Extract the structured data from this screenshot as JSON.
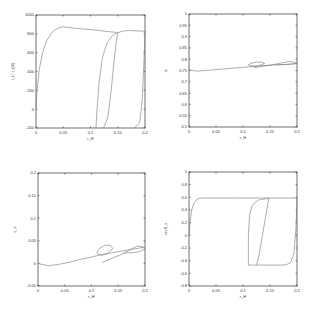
{
  "chart_data": [
    {
      "type": "line",
      "id": "top-left",
      "title": "",
      "xlabel": "r_H",
      "ylabel": "r_t / r_{t0}",
      "xlim": [
        0,
        0.2
      ],
      "ylim": [
        -200,
        1000
      ],
      "xticks": [
        "0",
        "0.05",
        "0.1",
        "0.15",
        "0.2"
      ],
      "yticks": [
        "-200",
        "0",
        "200",
        "400",
        "600",
        "800",
        "1000"
      ],
      "series": [
        {
          "name": "branch-1",
          "x": [
            0.0,
            0.002,
            0.006,
            0.012,
            0.02,
            0.03,
            0.04,
            0.05,
            0.07,
            0.09,
            0.11,
            0.13,
            0.148,
            0.15
          ],
          "y": [
            20,
            200,
            420,
            600,
            730,
            820,
            860,
            875,
            860,
            850,
            840,
            825,
            815,
            812
          ]
        },
        {
          "name": "branch-2",
          "x": [
            0.11,
            0.112,
            0.116,
            0.122,
            0.13,
            0.14,
            0.148
          ],
          "y": [
            -200,
            0,
            300,
            550,
            700,
            780,
            812
          ]
        },
        {
          "name": "branch-3",
          "x": [
            0.124,
            0.132,
            0.138,
            0.143,
            0.147,
            0.15
          ],
          "y": [
            -200,
            -80,
            200,
            500,
            700,
            812
          ]
        },
        {
          "name": "branch-4",
          "x": [
            0.15,
            0.16,
            0.17,
            0.18,
            0.19,
            0.2
          ],
          "y": [
            812,
            830,
            835,
            832,
            830,
            828
          ]
        },
        {
          "name": "branch-5",
          "x": [
            0.18,
            0.19,
            0.195,
            0.198,
            0.2
          ],
          "y": [
            -200,
            -150,
            100,
            500,
            828
          ]
        }
      ]
    },
    {
      "type": "line",
      "id": "top-right",
      "title": "",
      "xlabel": "r_H",
      "ylabel": "a",
      "xlim": [
        0,
        0.2
      ],
      "ylim": [
        0.5,
        1
      ],
      "xticks": [
        "0",
        "0.05",
        "0.1",
        "0.15",
        "0.2"
      ],
      "yticks": [
        "0.5",
        "0.55",
        "0.6",
        "0.65",
        "0.7",
        "0.75",
        "0.8",
        "0.85",
        "0.9",
        "0.95",
        "1"
      ],
      "series": [
        {
          "name": "main",
          "x": [
            0.0,
            0.01,
            0.02,
            0.04,
            0.06,
            0.08,
            0.1,
            0.11,
            0.12,
            0.135,
            0.15,
            0.17,
            0.19,
            0.2
          ],
          "y": [
            0.755,
            0.748,
            0.748,
            0.752,
            0.756,
            0.76,
            0.764,
            0.766,
            0.768,
            0.771,
            0.773,
            0.776,
            0.779,
            0.78
          ]
        },
        {
          "name": "loop-1",
          "x": [
            0.11,
            0.115,
            0.125,
            0.135,
            0.14,
            0.13,
            0.12,
            0.112,
            0.11
          ],
          "y": [
            0.775,
            0.782,
            0.787,
            0.787,
            0.781,
            0.772,
            0.77,
            0.771,
            0.775
          ]
        },
        {
          "name": "loop-2",
          "x": [
            0.12,
            0.14,
            0.16,
            0.175,
            0.185,
            0.195,
            0.2,
            0.19,
            0.18,
            0.16
          ],
          "y": [
            0.762,
            0.77,
            0.778,
            0.785,
            0.79,
            0.787,
            0.783,
            0.778,
            0.776,
            0.775
          ]
        }
      ]
    },
    {
      "type": "line",
      "id": "bottom-left",
      "title": "",
      "xlabel": "r_H",
      "ylabel": "s_e",
      "xlim": [
        0,
        0.2
      ],
      "ylim": [
        -0.05,
        0.2
      ],
      "xticks": [
        "0",
        "0.05",
        "0.1",
        "0.15",
        "0.2"
      ],
      "yticks": [
        "-0.05",
        "0",
        "0.05",
        "0.1",
        "0.15",
        "0.2"
      ],
      "series": [
        {
          "name": "main",
          "x": [
            0.0,
            0.01,
            0.02,
            0.04,
            0.06,
            0.08,
            0.1,
            0.11,
            0.12,
            0.135,
            0.15,
            0.17,
            0.19,
            0.2
          ],
          "y": [
            0.0,
            -0.003,
            -0.005,
            -0.002,
            0.003,
            0.009,
            0.014,
            0.017,
            0.02,
            0.023,
            0.026,
            0.03,
            0.034,
            0.036
          ]
        },
        {
          "name": "loop-1",
          "x": [
            0.11,
            0.115,
            0.125,
            0.135,
            0.14,
            0.13,
            0.12,
            0.112,
            0.11
          ],
          "y": [
            0.025,
            0.033,
            0.04,
            0.04,
            0.033,
            0.022,
            0.018,
            0.02,
            0.025
          ]
        },
        {
          "name": "loop-2",
          "x": [
            0.12,
            0.14,
            0.16,
            0.175,
            0.185,
            0.195,
            0.2,
            0.19,
            0.18,
            0.16
          ],
          "y": [
            0.002,
            0.012,
            0.022,
            0.032,
            0.038,
            0.037,
            0.032,
            0.026,
            0.024,
            0.023
          ]
        }
      ]
    },
    {
      "type": "line",
      "id": "bottom-right",
      "title": "",
      "xlabel": "r_H",
      "ylabel": "sin θ_s",
      "xlim": [
        0,
        0.2
      ],
      "ylim": [
        -0.8,
        1
      ],
      "xticks": [
        "0",
        "0.05",
        "0.1",
        "0.15",
        "0.2"
      ],
      "yticks": [
        "-0.8",
        "-0.6",
        "-0.4",
        "-0.2",
        "0",
        "0.2",
        "0.4",
        "0.6",
        "0.8",
        "1"
      ],
      "series": [
        {
          "name": "branch-1",
          "x": [
            0.0,
            0.002,
            0.005,
            0.01,
            0.015,
            0.02,
            0.03,
            0.05,
            0.08,
            0.1,
            0.15,
            0.2
          ],
          "y": [
            0.0,
            0.2,
            0.4,
            0.52,
            0.57,
            0.585,
            0.59,
            0.59,
            0.59,
            0.59,
            0.59,
            0.59
          ]
        },
        {
          "name": "branch-2",
          "x": [
            0.11,
            0.11,
            0.112,
            0.116,
            0.122,
            0.13,
            0.14,
            0.148
          ],
          "y": [
            -0.47,
            0.0,
            0.3,
            0.45,
            0.52,
            0.56,
            0.575,
            0.585
          ]
        },
        {
          "name": "branch-3",
          "x": [
            0.11,
            0.12,
            0.125
          ],
          "y": [
            -0.47,
            -0.47,
            -0.47
          ]
        },
        {
          "name": "branch-4",
          "x": [
            0.125,
            0.13,
            0.136,
            0.142,
            0.146,
            0.148
          ],
          "y": [
            -0.47,
            -0.3,
            0.0,
            0.3,
            0.5,
            0.585
          ]
        },
        {
          "name": "branch-5",
          "x": [
            0.125,
            0.15,
            0.17,
            0.18,
            0.188,
            0.194,
            0.198,
            0.2
          ],
          "y": [
            -0.47,
            -0.47,
            -0.47,
            -0.465,
            -0.43,
            -0.3,
            0.1,
            0.59
          ]
        }
      ]
    }
  ]
}
